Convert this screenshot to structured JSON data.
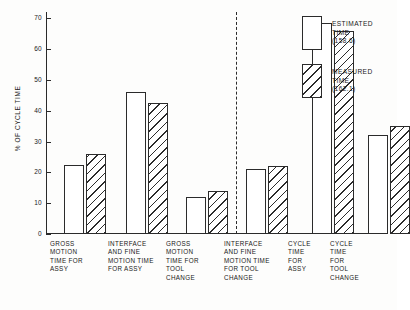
{
  "chart_data": {
    "type": "bar",
    "title": "",
    "xlabel": "",
    "ylabel": "% OF CYCLE TIME",
    "ylim": [
      0,
      72
    ],
    "yticks": [
      0,
      10,
      20,
      30,
      40,
      50,
      60,
      70
    ],
    "ytick_labels": [
      "0",
      "10",
      "20",
      "30",
      "40",
      "50",
      "60",
      "70"
    ],
    "grid": false,
    "legend_position": "upper-right",
    "categories": [
      "GROSS\nMOTION\nTIME FOR\nASSY",
      "INTERFACE\nAND FINE\nMOTION TIME\nFOR ASSY",
      "GROSS\nMOTION\nTIME FOR\nTOOL\nCHANGE",
      "INTERFACE\nAND FINE\nMOTION TIME\nFOR TOOL\nCHANGE",
      "CYCLE\nTIME\nFOR\nASSY",
      "CYCLE\nTIME\nFOR\nTOOL\nCHANGE"
    ],
    "series": [
      {
        "name": "ESTIMATED\nTIME (158.6)",
        "style": "open",
        "values": [
          22.5,
          46.0,
          12.0,
          21.0,
          68.5,
          32.0
        ]
      },
      {
        "name": "MEASURED\nTIME (162.1)",
        "style": "hatched",
        "values": [
          26.0,
          42.5,
          14.0,
          22.0,
          66.0,
          35.0
        ]
      }
    ],
    "annotations": [
      {
        "type": "vertical-dashed-divider",
        "after_category_index": 3,
        "note": "separates component times from total cycle times"
      }
    ]
  },
  "legend": {
    "items": [
      {
        "label": "ESTIMATED\nTIME (158.6)",
        "swatch": "open"
      },
      {
        "label": "MEASURED\nTIME (162.1)",
        "swatch": "hatched"
      }
    ]
  },
  "colors": {
    "ink": "#2b2b2b",
    "background": "#fdfdfc"
  }
}
